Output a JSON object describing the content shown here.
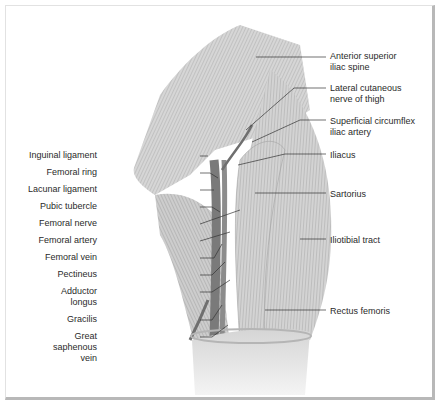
{
  "figure": {
    "left_labels": [
      {
        "id": "inguinal-ligament",
        "text": "Inguinal ligament",
        "x": 97,
        "y": 150,
        "w": 100
      },
      {
        "id": "femoral-ring",
        "text": "Femoral ring",
        "x": 97,
        "y": 167,
        "w": 100
      },
      {
        "id": "lacunar-ligament",
        "text": "Lacunar ligament",
        "x": 97,
        "y": 184,
        "w": 100
      },
      {
        "id": "pubic-tubercle",
        "text": "Pubic tubercle",
        "x": 97,
        "y": 201,
        "w": 100
      },
      {
        "id": "femoral-nerve",
        "text": "Femoral nerve",
        "x": 97,
        "y": 218,
        "w": 100
      },
      {
        "id": "femoral-artery",
        "text": "Femoral artery",
        "x": 97,
        "y": 235,
        "w": 100
      },
      {
        "id": "femoral-vein",
        "text": "Femoral vein",
        "x": 97,
        "y": 252,
        "w": 100
      },
      {
        "id": "pectineus",
        "text": "Pectineus",
        "x": 97,
        "y": 269,
        "w": 100
      },
      {
        "id": "adductor-longus",
        "text": "Adductor\nlongus",
        "x": 97,
        "y": 286,
        "w": 100
      },
      {
        "id": "gracilis",
        "text": "Gracilis",
        "x": 97,
        "y": 314,
        "w": 100
      },
      {
        "id": "great-saphenous-vein",
        "text": "Great\nsaphenous\nvein",
        "x": 97,
        "y": 331,
        "w": 100
      }
    ],
    "right_labels": [
      {
        "id": "anterior-superior-iliac-spine",
        "text": "Anterior superior\niliac spine",
        "x": 330,
        "y": 51
      },
      {
        "id": "lateral-cutaneous-nerve",
        "text": "Lateral cutaneous\nnerve of thigh",
        "x": 330,
        "y": 83
      },
      {
        "id": "superficial-circumflex-iliac-artery",
        "text": "Superficial circumflex\niliac artery",
        "x": 330,
        "y": 116
      },
      {
        "id": "iliacus",
        "text": "Iliacus",
        "x": 330,
        "y": 150
      },
      {
        "id": "sartorius",
        "text": "Sartorius",
        "x": 330,
        "y": 189
      },
      {
        "id": "iliotibial-tract",
        "text": "Iliotibial tract",
        "x": 330,
        "y": 235
      },
      {
        "id": "rectus-femoris",
        "text": "Rectus femoris",
        "x": 330,
        "y": 306
      }
    ]
  }
}
